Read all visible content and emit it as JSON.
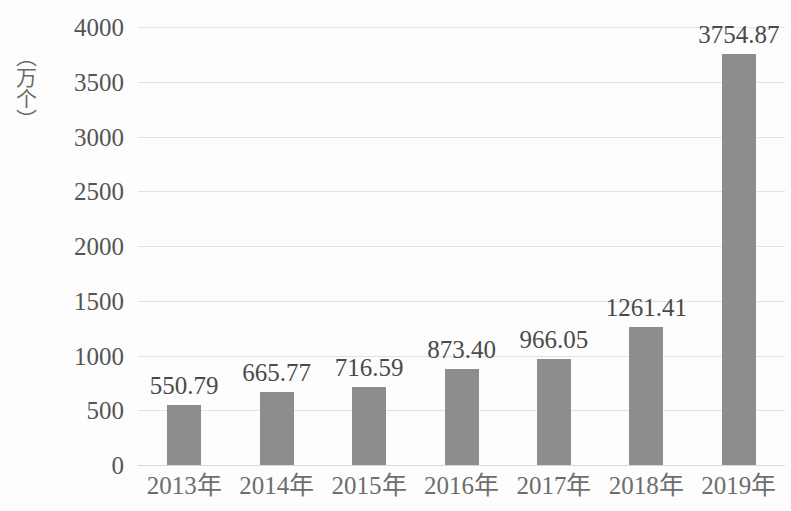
{
  "chart_data": {
    "type": "bar",
    "title": "",
    "subtitle": "",
    "xlabel": "",
    "ylabel": "（万个）",
    "categories": [
      "2013年",
      "2014年",
      "2015年",
      "2016年",
      "2017年",
      "2018年",
      "2019年"
    ],
    "values": [
      550.79,
      665.77,
      716.59,
      873.4,
      966.05,
      1261.41,
      3754.87
    ],
    "value_labels": [
      "550.79",
      "665.77",
      "716.59",
      "873.40",
      "966.05",
      "1261.41",
      "3754.87"
    ],
    "ylim": [
      0,
      4000
    ],
    "ytick_labels": [
      "0",
      "500",
      "1000",
      "1500",
      "2000",
      "2500",
      "3000",
      "3500",
      "4000"
    ],
    "ytick_values": [
      0,
      500,
      1000,
      1500,
      2000,
      2500,
      3000,
      3500,
      4000
    ],
    "grid": true,
    "legend": false,
    "legend_position": "none",
    "series": [
      {
        "name": "",
        "values": [
          550.79,
          665.77,
          716.59,
          873.4,
          966.05,
          1261.41,
          3754.87
        ],
        "color": "#8d8d8d"
      }
    ],
    "colors": {
      "bar": "#8d8d8d",
      "gridline": "#e2e2e2",
      "tick_text": "#555555",
      "value_text": "#4a4a4a",
      "axis_title": "#6a6a6a",
      "background": "#fdfdfd"
    }
  }
}
